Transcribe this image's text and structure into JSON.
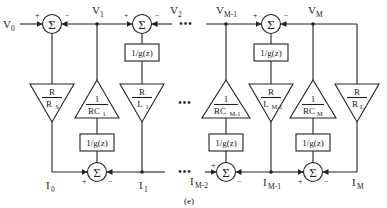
{
  "figure": {
    "caption": "(e)",
    "sum_symbol": "Σ",
    "plus": "+",
    "minus": "−",
    "ellipsis": "•••",
    "g_block": "1/g(z)"
  },
  "top_labels": {
    "v0": {
      "main": "V",
      "sub": "0"
    },
    "v1": {
      "main": "V",
      "sub": "1"
    },
    "v2": {
      "main": "V",
      "sub": "2"
    },
    "vm1": {
      "main": "V",
      "sub": "M-1"
    },
    "vm": {
      "main": "V",
      "sub": "M"
    }
  },
  "bottom_labels": {
    "i0": {
      "main": "I",
      "sub": "0"
    },
    "i1": {
      "main": "I",
      "sub": "1"
    },
    "im2": {
      "main": "I",
      "sub": "M-2"
    },
    "im1": {
      "main": "I",
      "sub": "M-1"
    },
    "im": {
      "main": "I",
      "sub": "M"
    }
  },
  "gains": {
    "rs": {
      "num": "R",
      "den": "R",
      "den_sub": "S"
    },
    "rc1": {
      "num": "1",
      "den": "RC",
      "den_sub": "1"
    },
    "l1": {
      "num": "R",
      "den": "L",
      "den_sub": "1"
    },
    "rcm1": {
      "num": "1",
      "den": "RC",
      "den_sub": "M-1"
    },
    "lm1": {
      "num": "R",
      "den": "L",
      "den_sub": "M-1"
    },
    "rcm": {
      "num": "1",
      "den": "RC",
      "den_sub": "M"
    },
    "rl": {
      "num": "R",
      "den": "R",
      "den_sub": "L"
    }
  }
}
